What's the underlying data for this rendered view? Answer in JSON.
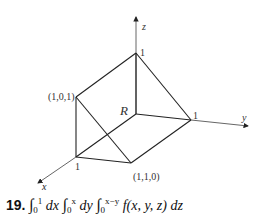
{
  "figure": {
    "axes": {
      "x_label": "x",
      "y_label": "y",
      "z_label": "z"
    },
    "region_label": "R",
    "vertex_labels": {
      "z_top": "1",
      "y_one": "1",
      "x_one": "1",
      "point_101": "(1,0,1)",
      "point_110": "(1,1,0)"
    }
  },
  "problem": {
    "number": "19.",
    "integral_1": {
      "lower": "0",
      "upper": "1",
      "diff": "dx"
    },
    "integral_2": {
      "lower": "0",
      "upper": "x",
      "diff": "dy"
    },
    "integral_3": {
      "lower": "0",
      "upper": "x−y",
      "integrand": "f(x, y, z)",
      "diff": "dz"
    },
    "stray_mark": "x"
  }
}
